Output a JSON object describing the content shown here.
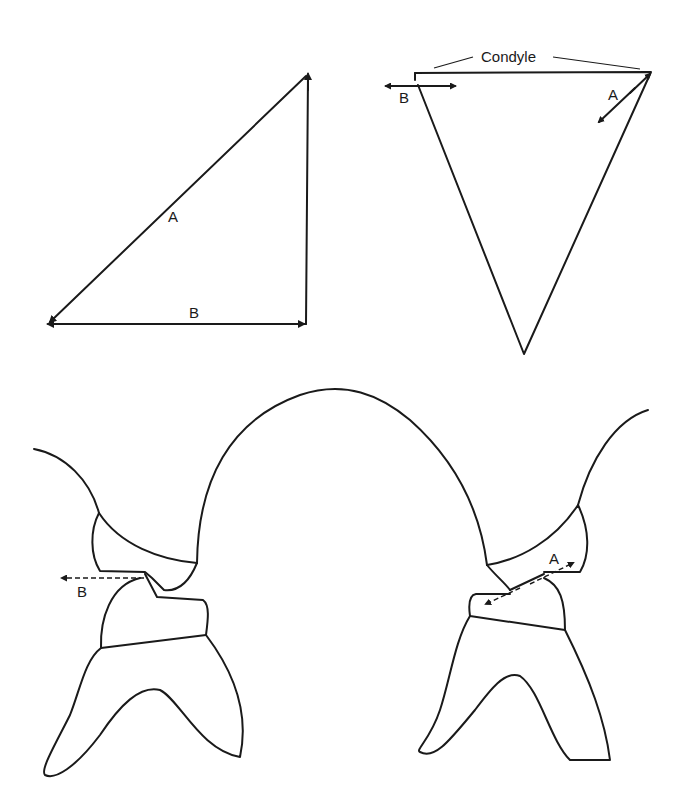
{
  "diagram": {
    "panels": [
      {
        "id": "right-triangle",
        "labels": {
          "hypotenuse": "A",
          "base": "B"
        }
      },
      {
        "id": "inverted-triangle",
        "labels": {
          "top": "Condyle",
          "left_arrow": "B",
          "right_arrow": "A"
        }
      },
      {
        "id": "left-tooth-contact",
        "labels": {
          "arrow": "B"
        }
      },
      {
        "id": "right-tooth-contact",
        "labels": {
          "arrow": "A"
        }
      }
    ],
    "stroke_color": "#1a1a1a",
    "background": "#ffffff"
  }
}
